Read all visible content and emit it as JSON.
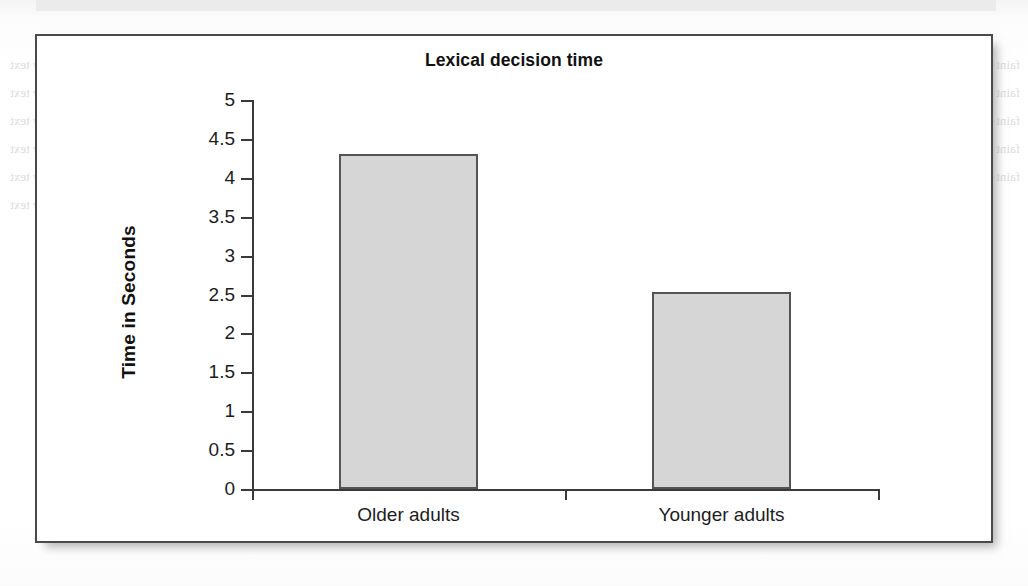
{
  "figure": {
    "frame": {
      "border_color": "#4a4a4a"
    }
  },
  "chart_data": {
    "type": "bar",
    "title": "Lexical decision time",
    "xlabel": "",
    "ylabel": "Time in Seconds",
    "categories": [
      "Older adults",
      "Younger adults"
    ],
    "values": [
      4.31,
      2.53
    ],
    "ylim": [
      0,
      5
    ],
    "ytick_labels": [
      "0",
      "0.5",
      "1",
      "1.5",
      "2",
      "2.5",
      "3",
      "3.5",
      "4",
      "4.5",
      "5"
    ],
    "ytick_values": [
      0,
      0.5,
      1,
      1.5,
      2,
      2.5,
      3,
      3.5,
      4,
      4.5,
      5
    ],
    "grid": false,
    "legend": null,
    "bar_fill_color": "#d6d6d6",
    "bar_edge_color": "#545454",
    "axis_color": "#3a3a3a"
  },
  "bleed_through": {
    "note": "faint show-through text from the reverse / adjacent book page",
    "left_column": [
      "lines of faint reversed body text",
      "lines of faint reversed body text",
      "lines of faint reversed body text",
      "lines of faint reversed body text",
      "lines of faint reversed body text",
      "lines of faint reversed body text"
    ],
    "right_column": [
      "faint reversed body text line",
      "faint reversed body text line",
      "faint reversed body text line",
      "faint reversed body text line",
      "faint reversed body text line"
    ],
    "heading": "THEORIES OF AGING AND MEMORY",
    "subheading": "Retarding Speed"
  }
}
